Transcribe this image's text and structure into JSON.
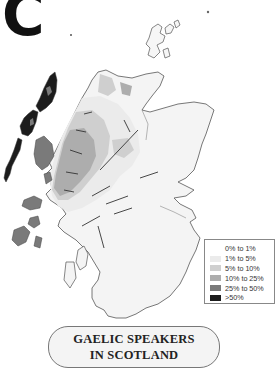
{
  "panel_label": "C",
  "title": {
    "line1": "GAELIC SPEAKERS",
    "line2": "IN SCOTLAND"
  },
  "legend": {
    "items": [
      {
        "label": "0% to 1%",
        "color": "#ffffff"
      },
      {
        "label": "1% to 5%",
        "color": "#ebebeb"
      },
      {
        "label": "5% to 10%",
        "color": "#cfcfcf"
      },
      {
        "label": "10% to 25%",
        "color": "#adadad"
      },
      {
        "label": "25% to 50%",
        "color": "#7a7a7a"
      },
      {
        "label": ">50%",
        "color": "#1c1c1c"
      }
    ]
  },
  "colors": {
    "outline": "#555555",
    "background": "#ffffff"
  }
}
